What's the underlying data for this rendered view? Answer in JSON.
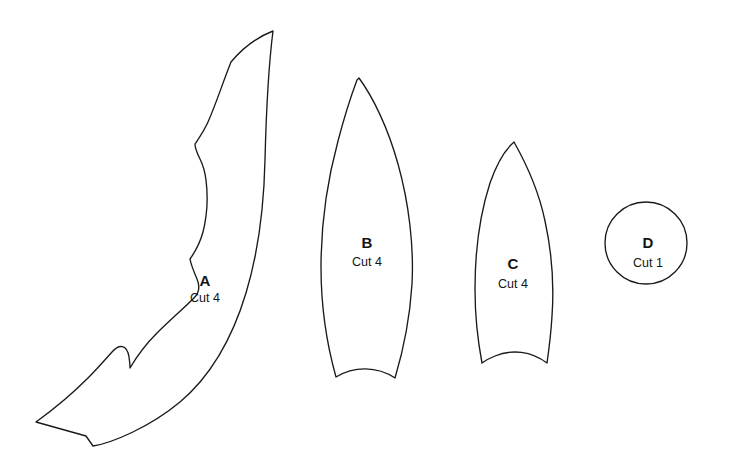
{
  "diagram": {
    "background_color": "#ffffff",
    "outline_color": "#1a1a1a",
    "text_color": "#141414",
    "pieces": [
      {
        "id": "a",
        "letter": "A",
        "cut_label": "Cut 4",
        "shape_name": "long-curved-scalloped-leaf",
        "letter_pos": {
          "x": 205,
          "y": 286
        },
        "cut_pos": {
          "x": 205,
          "y": 302
        },
        "path": "M 273 31 C 268 70 266 120 265 160 C 264 205 259 250 246 293 C 233 336 212 375 180 402 C 150 427 112 443 93 446 L 86 436 L 36 422 C 54 409 72 394 88 378 C 96 370 104 361 112 352 C 119 344 127 344 129 357 C 130 363 130 366 130 368 C 137 356 146 344 157 333 C 170 320 183 309 194 298 C 200 292 200 286 197 279 C 194 272 191 265 190 259 C 195 252 200 243 203 232 C 207 216 208 196 206 180 C 205 172 203 165 200 159 C 197 153 195 148 195 144 C 199 138 204 131 208 122 C 216 104 223 82 231 62 C 241 50 255 38 273 31 Z"
      },
      {
        "id": "b",
        "letter": "B",
        "cut_label": "Cut 4",
        "shape_name": "pointed-petal-leaf",
        "letter_pos": {
          "x": 367,
          "y": 248
        },
        "cut_pos": {
          "x": 367,
          "y": 266
        },
        "path": "M 359 78 C 373 97 388 128 398 164 C 409 203 414 247 412 284 C 410 316 404 348 395 378 C 377 366 354 366 336 377 C 327 345 321 306 321 267 C 321 223 328 178 338 141 C 344 118 351 96 357 80 Z"
      },
      {
        "id": "c",
        "letter": "C",
        "cut_label": "Cut 4",
        "shape_name": "symmetric-pointed-leaf",
        "letter_pos": {
          "x": 513,
          "y": 269
        },
        "cut_pos": {
          "x": 513,
          "y": 288
        },
        "path": "M 514 142 C 527 165 539 192 545 221 C 552 253 554 288 552 316 C 551 333 549 349 547 363 C 531 351 512 349 495 356 C 490 358 486 360 482 363 C 478 342 475 316 475 289 C 475 252 480 214 490 183 C 497 163 505 150 513 143 Z"
      },
      {
        "id": "d",
        "letter": "D",
        "cut_label": "Cut 1",
        "shape_name": "circle",
        "letter_pos": {
          "x": 648,
          "y": 248
        },
        "cut_pos": {
          "x": 648,
          "y": 267
        },
        "circle": {
          "cx": 646,
          "cy": 243,
          "r": 41
        }
      }
    ]
  }
}
